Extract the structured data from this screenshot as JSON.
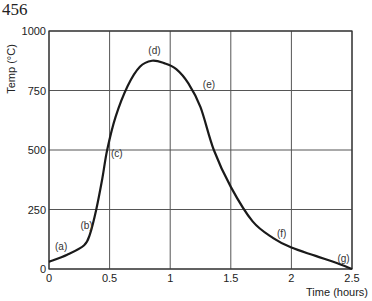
{
  "page": {
    "number": "456"
  },
  "chart_data": {
    "type": "line",
    "title": "",
    "xlabel": "Time (hours)",
    "ylabel": "Temp (°C)",
    "xlim": [
      0,
      2.5
    ],
    "ylim": [
      0,
      1000
    ],
    "grid": true,
    "x_ticks": [
      "0",
      "0.5",
      "1",
      "1.5",
      "2",
      "2.5"
    ],
    "y_ticks": [
      "0",
      "250",
      "500",
      "750",
      "1000"
    ],
    "series": [
      {
        "name": "Temperature",
        "x": [
          0,
          0.15,
          0.29,
          0.34,
          0.39,
          0.44,
          0.48,
          0.55,
          0.65,
          0.75,
          0.85,
          0.95,
          1.05,
          1.15,
          1.25,
          1.36,
          1.5,
          1.68,
          1.85,
          2.0,
          2.2,
          2.4,
          2.5
        ],
        "values": [
          30,
          60,
          100,
          150,
          250,
          380,
          500,
          640,
          770,
          850,
          875,
          865,
          840,
          780,
          680,
          500,
          345,
          200,
          130,
          90,
          55,
          20,
          0
        ]
      }
    ],
    "annotations": [
      {
        "label": "(a)",
        "x": 0.1,
        "y": 80
      },
      {
        "label": "(b)",
        "x": 0.31,
        "y": 170
      },
      {
        "label": "(c)",
        "x": 0.56,
        "y": 470
      },
      {
        "label": "(d)",
        "x": 0.87,
        "y": 905
      },
      {
        "label": "(e)",
        "x": 1.32,
        "y": 760
      },
      {
        "label": "(f)",
        "x": 1.92,
        "y": 135
      },
      {
        "label": "(g)",
        "x": 2.43,
        "y": 30
      }
    ]
  }
}
